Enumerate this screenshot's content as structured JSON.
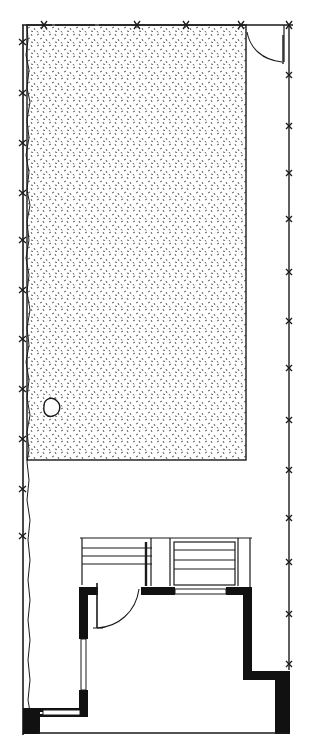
{
  "drawing": {
    "type": "architectural-site-plan",
    "width": 310,
    "height": 752,
    "colors": {
      "background": "#ffffff",
      "ink": "#1a1a1a",
      "wall_fill": "#111111",
      "stipple": "#333333"
    }
  },
  "plan": {
    "boundary": {
      "left_x": 23,
      "right_x": 289,
      "top_y": 25,
      "bottom_y": 733
    },
    "lawn": {
      "x": 27,
      "y": 25,
      "w": 219,
      "h": 435
    },
    "tree": {
      "cx": 51,
      "cy": 410,
      "r": 8
    },
    "gate": {
      "hinge_x": 247,
      "hinge_y": 27,
      "radius": 38
    },
    "right_fence_marks": [
      25,
      75,
      126,
      173,
      219,
      272,
      321,
      368,
      420,
      470,
      518,
      562,
      614,
      664
    ],
    "left_fence_marks": [
      42,
      93,
      143,
      193,
      240,
      290,
      339,
      385,
      437,
      488,
      536
    ],
    "top_fence_marks": [
      44,
      137,
      186,
      241,
      289
    ]
  }
}
